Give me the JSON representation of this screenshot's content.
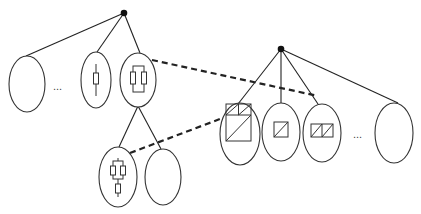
{
  "diagram": {
    "title": "",
    "colors": {
      "line": "#222222",
      "node_stroke": "#333333",
      "background": "#ffffff"
    },
    "left_tree": {
      "root": {
        "x": 124,
        "y": 13
      },
      "children": [
        {
          "id": "A",
          "cx": 27,
          "cy": 84,
          "glyph": "empty"
        },
        {
          "id": "dots-left",
          "label": "...",
          "x": 60,
          "y": 89
        },
        {
          "id": "B",
          "cx": 96,
          "cy": 80,
          "glyph": "single-resistor"
        },
        {
          "id": "C",
          "cx": 138,
          "cy": 80,
          "glyph": "parallel-resistors",
          "children": [
            {
              "id": "D",
              "cx": 118,
              "cy": 177,
              "glyph": "parallel-plus-series"
            },
            {
              "id": "E",
              "cx": 163,
              "cy": 177,
              "glyph": "empty"
            }
          ]
        }
      ]
    },
    "right_tree": {
      "root": {
        "x": 281,
        "y": 49
      },
      "children": [
        {
          "id": "F",
          "cx": 240,
          "cy": 134,
          "glyph": "composite-squares"
        },
        {
          "id": "G",
          "cx": 281,
          "cy": 132,
          "glyph": "single-split-square"
        },
        {
          "id": "H",
          "cx": 322,
          "cy": 133,
          "glyph": "double-split-square"
        },
        {
          "id": "dots-right",
          "label": "...",
          "x": 360,
          "y": 137
        },
        {
          "id": "I",
          "cx": 394,
          "cy": 133,
          "glyph": "empty"
        }
      ]
    },
    "correspondences": [
      {
        "from": "C",
        "to": "H",
        "style": "dashed"
      },
      {
        "from": "D",
        "to": "F",
        "style": "dashed"
      }
    ],
    "labels": {
      "ellipsis_left": "...",
      "ellipsis_right": "..."
    }
  }
}
